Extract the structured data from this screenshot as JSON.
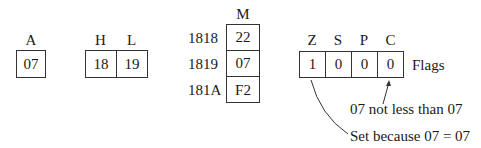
{
  "registers": {
    "a": {
      "label": "A",
      "value": "07"
    },
    "hl": {
      "labels": [
        "H",
        "L"
      ],
      "values": [
        "18",
        "19"
      ]
    }
  },
  "memory": {
    "label": "M",
    "rows": [
      {
        "address": "1818",
        "value": "22"
      },
      {
        "address": "1819",
        "value": "07"
      },
      {
        "address": "181A",
        "value": "F2"
      }
    ]
  },
  "flags": {
    "label": "Flags",
    "names": [
      "Z",
      "S",
      "P",
      "C"
    ],
    "values": [
      "1",
      "0",
      "0",
      "0"
    ]
  },
  "annotations": {
    "carry_note": "07 not less than 07",
    "zero_note": "Set because 07 = 07"
  }
}
